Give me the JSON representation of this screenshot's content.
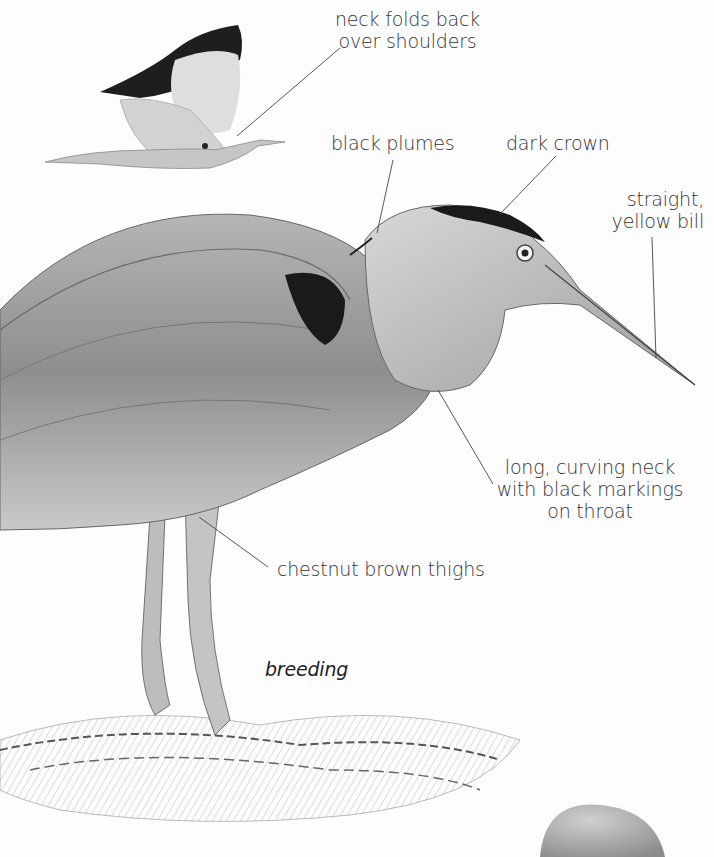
{
  "figure": {
    "plumage_label": "breeding",
    "colors": {
      "background": "#fdfdfd",
      "ink": "#333333",
      "plumage_grey": "#9a9a9a",
      "dark": "#1e1e1e"
    }
  },
  "annotations": [
    {
      "id": "neck",
      "lines": [
        "neck folds back",
        "over shoulders"
      ]
    },
    {
      "id": "plumes",
      "lines": [
        "black plumes"
      ]
    },
    {
      "id": "crown",
      "lines": [
        "dark crown"
      ]
    },
    {
      "id": "bill",
      "lines": [
        "straight,",
        "yellow bill"
      ]
    },
    {
      "id": "throat",
      "lines": [
        "long, curving neck",
        "with black markings",
        "on throat"
      ]
    },
    {
      "id": "thighs",
      "lines": [
        "chestnut brown thighs"
      ]
    }
  ]
}
